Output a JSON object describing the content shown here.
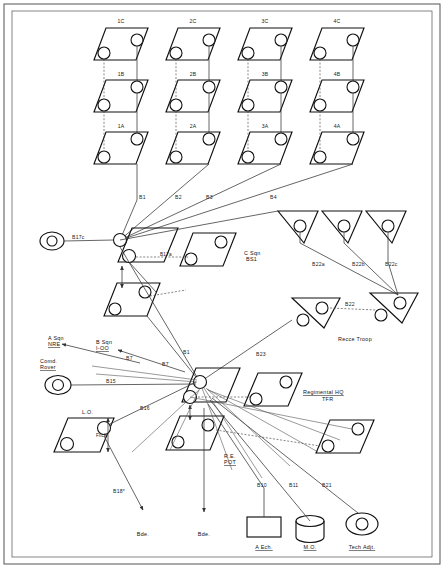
{
  "document": {
    "type": "military-command-net-diagram",
    "background_color": "#ffffff",
    "line_color": "#333333",
    "symbol_color": "#111111"
  },
  "troops": {
    "columns": [
      "1",
      "2",
      "3",
      "4"
    ],
    "rows": [
      "C",
      "B",
      "A"
    ],
    "labels": [
      "1C",
      "2C",
      "3C",
      "4C",
      "1B",
      "2B",
      "3B",
      "4B",
      "1A",
      "2A",
      "3A",
      "4A"
    ]
  },
  "squadron": {
    "name": "C Sqn",
    "callsign": "BS1"
  },
  "recce": {
    "title": "Recce Troop",
    "link_label": "B22",
    "section_labels": [
      "B22a",
      "B22b",
      "B22c"
    ]
  },
  "rhq": {
    "title": "Regimental HQ",
    "subtitle": "TFR"
  },
  "net_links": {
    "troop_links": [
      "B1",
      "B2",
      "B3",
      "B4"
    ],
    "hub_links": [
      "B1",
      "B23",
      "B7",
      "B15",
      "B16",
      "B18*"
    ],
    "rear_links": [
      "B10",
      "B11",
      "B21"
    ],
    "lateral": "B17c",
    "inner": "B17a"
  },
  "side_units": {
    "a_sqn": "A Sqn\nNRE",
    "a_sqn_line1": "A Sqn",
    "a_sqn_line2": "NRE",
    "b_sqn_line1": "B Sqn",
    "b_sqn_line2": "I-OO",
    "comd_rover_line1": "Comd.",
    "comd_rover_line2": "Rover",
    "lo": "L.O.",
    "flick": "Flick",
    "re_pot_line1": "R.E.",
    "re_pot_line2": "POT"
  },
  "rear_units": {
    "a_ech": "A Ech.",
    "mo": "M.O.",
    "tech_adjt": "Tech Adjt."
  },
  "brigade": {
    "left": "Bde.",
    "right": "Bde."
  },
  "axis_labels": {
    "b7_left": "B7",
    "b7_right": "B7"
  }
}
